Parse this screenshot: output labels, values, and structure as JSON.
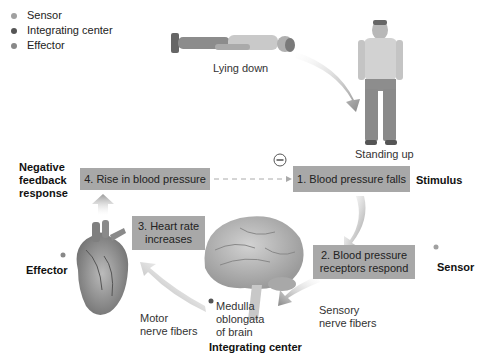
{
  "legend": {
    "items": [
      {
        "label": "Sensor",
        "color": "#a0a0a0"
      },
      {
        "label": "Integrating center",
        "color": "#555555"
      },
      {
        "label": "Effector",
        "color": "#888888"
      }
    ]
  },
  "figures": {
    "lying_label": "Lying down",
    "standing_label": "Standing up"
  },
  "steps": {
    "step1": "1. Blood pressure falls",
    "step2_line1": "2. Blood pressure",
    "step2_line2": "receptors respond",
    "step3_line1": "3. Heart rate",
    "step3_line2": "increases",
    "step4": "4. Rise in blood pressure"
  },
  "roles": {
    "stimulus": "Stimulus",
    "sensor": "Sensor",
    "effector": "Effector",
    "integrating_center": "Integrating center",
    "negative_feedback_line1": "Negative",
    "negative_feedback_line2": "feedback",
    "negative_feedback_line3": "response"
  },
  "annotations": {
    "minus_symbol": "−",
    "sensory_line1": "Sensory",
    "sensory_line2": "nerve fibers",
    "motor_line1": "Motor",
    "motor_line2": "nerve fibers",
    "medulla_line1": "Medulla",
    "medulla_line2": "oblongata",
    "medulla_line3": "of brain"
  },
  "colors": {
    "box_fill": "#a8a8a8",
    "arrow": "#8a8a8a"
  }
}
